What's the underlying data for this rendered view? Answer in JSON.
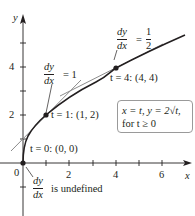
{
  "figure": {
    "axes": {
      "x_label": "x",
      "y_label": "y",
      "origin_label": "0",
      "x_tick_labels": [
        "2",
        "4",
        "6"
      ],
      "y_tick_labels": [
        "2",
        "4"
      ]
    },
    "points": [
      {
        "label": "t = 0: (0, 0)",
        "x": 0,
        "y": 0
      },
      {
        "label": "t = 1: (1, 2)",
        "x": 1,
        "y": 2
      },
      {
        "label": "t = 4: (4, 4)",
        "x": 4,
        "y": 4
      }
    ],
    "slope_annotations": [
      {
        "numerator": "dy",
        "denominator": "dx",
        "relation": "= 1"
      },
      {
        "numerator": "dy",
        "denominator": "dx",
        "relation": "=",
        "value_num": "1",
        "value_den": "2"
      },
      {
        "numerator": "dy",
        "denominator": "dx",
        "relation": "is undefined"
      }
    ],
    "definition_box": {
      "line1": "x = t, y = 2√t,",
      "line2": "for t ≥ 0"
    },
    "colors": {
      "curve": "#231f20",
      "tangent": "#8c8c8c",
      "axis": "#231f20",
      "box_border": "#9a9a9a"
    }
  }
}
